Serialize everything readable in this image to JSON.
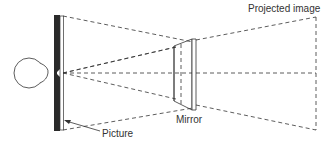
{
  "diagram": {
    "labels": {
      "projected_image": "Projected image",
      "mirror": "Mirror",
      "picture": "Picture"
    },
    "components": [
      "eye",
      "picture",
      "mirror",
      "projected-image-plane"
    ],
    "colors": {
      "line": "#333333",
      "picture_fill": "#2a2a2a",
      "background": "#ffffff"
    }
  }
}
